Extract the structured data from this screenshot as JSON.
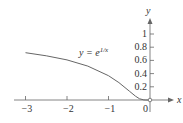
{
  "chart_data": {
    "type": "line",
    "title": "",
    "function_label": "y = e^{1/x}",
    "label_base": "y = e",
    "label_exp": "1/x",
    "xlabel": "x",
    "ylabel": "y",
    "xlim": [
      -3.3,
      0.6
    ],
    "ylim": [
      0,
      1.1
    ],
    "x_ticks": [
      -3,
      -2,
      -1,
      0
    ],
    "x_tick_labels": [
      "−3",
      "−2",
      "−1",
      "0"
    ],
    "y_ticks": [
      0.2,
      0.4,
      0.6,
      0.8,
      1
    ],
    "y_tick_labels": [
      "0.2",
      "0.4",
      "0.6",
      "0.8",
      "1"
    ],
    "grid": false,
    "series": [
      {
        "name": "y = e^{1/x}",
        "x": [
          -3,
          -2.5,
          -2,
          -1.5,
          -1,
          -0.75,
          -0.5,
          -0.35,
          -0.25,
          -0.15,
          -0.1,
          -0.05
        ],
        "y": [
          0.717,
          0.67,
          0.607,
          0.513,
          0.368,
          0.264,
          0.135,
          0.057,
          0.018,
          0.001,
          0.0,
          0.0
        ]
      }
    ]
  }
}
